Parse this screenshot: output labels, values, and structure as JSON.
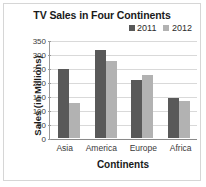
{
  "chart_data": {
    "type": "bar",
    "title": "TV Sales in Four Continents",
    "xlabel": "Continents",
    "ylabel": "Sales (in Millions)",
    "categories": [
      "Asia",
      "America",
      "Europe",
      "Africa"
    ],
    "series": [
      {
        "name": "2011",
        "values": [
          248,
          318,
          208,
          146
        ],
        "color": "#595959"
      },
      {
        "name": "2012",
        "values": [
          127,
          278,
          226,
          134
        ],
        "color": "#b2b2b2"
      }
    ],
    "ylim": [
      0,
      350
    ],
    "yticks": [
      0,
      50,
      100,
      150,
      200,
      250,
      300,
      350
    ],
    "ytick_labels": [
      "0",
      "50",
      "100",
      "150",
      "200",
      "250",
      "300",
      "350"
    ],
    "grid": true,
    "legend_position": "top-right"
  }
}
